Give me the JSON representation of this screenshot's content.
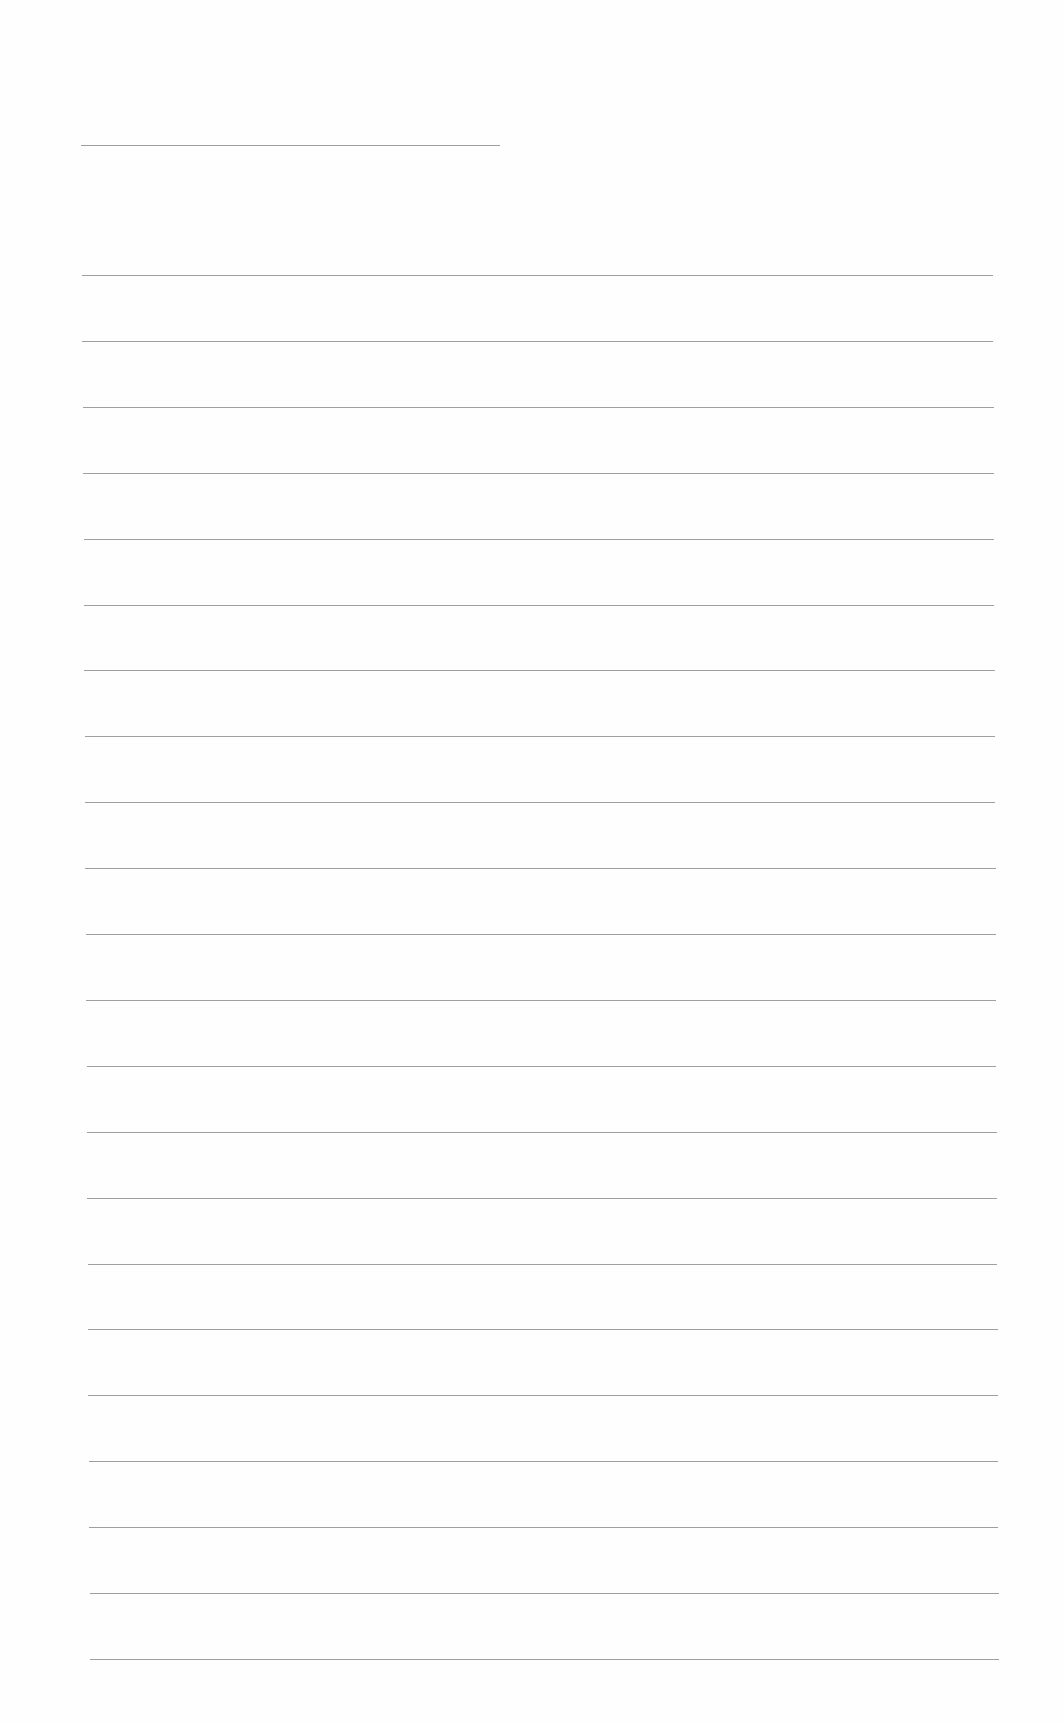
{
  "document": {
    "type": "lined-paper",
    "background_color": "#fefefe",
    "line_color": "#8e8e8e",
    "header_line": {
      "x1": 81,
      "x2": 500,
      "y": 145
    },
    "ruled_lines": {
      "count": 22,
      "first_y": 275,
      "spacing": 65.9,
      "x_start_top": 82,
      "x_end_top": 993,
      "x_start_bottom": 90,
      "x_end_bottom": 999
    },
    "text": []
  }
}
